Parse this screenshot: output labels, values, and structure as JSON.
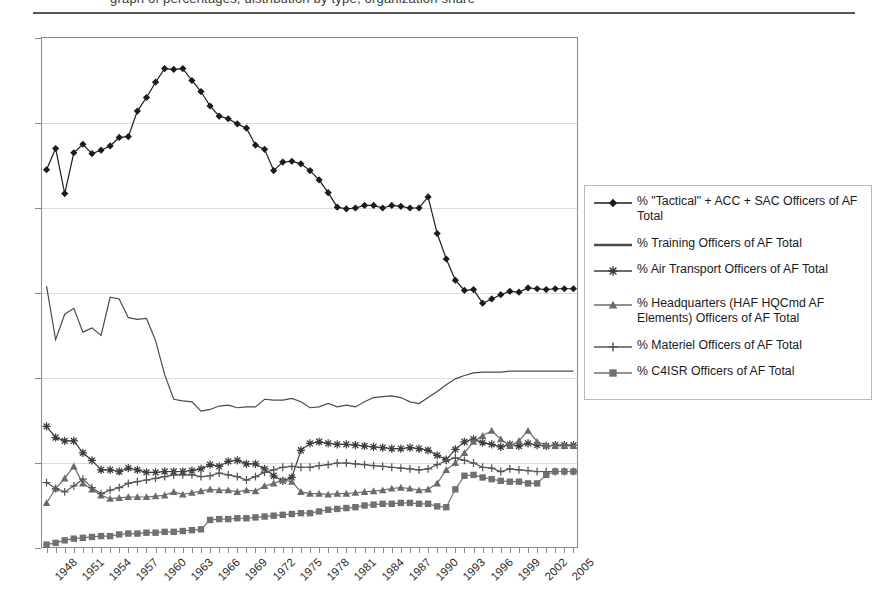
{
  "header": {
    "clipped_title_fragment": "graph of percentages, distribution by type, organization share",
    "rule": "horizontal-rule"
  },
  "legend": {
    "position": "right",
    "border_color": "#b9b9b9",
    "items": [
      {
        "label": "% \"Tactical\" + ACC + SAC Officers of AF Total",
        "marker": "diamond",
        "color": "#1b1b1b"
      },
      {
        "label": "% Training Officers of AF Total",
        "marker": "line",
        "color": "#4a4a4a"
      },
      {
        "label": "% Air Transport Officers of AF Total",
        "marker": "asterisk",
        "color": "#3d3d3d"
      },
      {
        "label": "% Headquarters (HAF HQCmd AF Elements) Officers of AF Total",
        "marker": "triangle",
        "color": "#6b6b6b"
      },
      {
        "label": "% Materiel Officers of AF Total",
        "marker": "plus",
        "color": "#555555"
      },
      {
        "label": "% C4ISR Officers of AF Total",
        "marker": "square",
        "color": "#707070"
      }
    ]
  },
  "chart_data": {
    "type": "line",
    "title": "",
    "xlabel": "",
    "ylabel": "",
    "ylim": [
      0,
      60
    ],
    "yticks": [
      "0%",
      "10%",
      "20%",
      "30%",
      "40%",
      "50%",
      "60%"
    ],
    "ytick_values": [
      0,
      10,
      20,
      30,
      40,
      50,
      60
    ],
    "grid": true,
    "legend_position": "right",
    "x": [
      1948,
      1949,
      1950,
      1951,
      1952,
      1953,
      1954,
      1955,
      1956,
      1957,
      1958,
      1959,
      1960,
      1961,
      1962,
      1963,
      1964,
      1965,
      1966,
      1967,
      1968,
      1969,
      1970,
      1971,
      1972,
      1973,
      1974,
      1975,
      1976,
      1977,
      1978,
      1979,
      1980,
      1981,
      1982,
      1983,
      1984,
      1985,
      1986,
      1987,
      1988,
      1989,
      1990,
      1991,
      1992,
      1993,
      1994,
      1995,
      1996,
      1997,
      1998,
      1999,
      2000,
      2001,
      2002,
      2003,
      2004,
      2005,
      2006
    ],
    "xtick_labels": [
      "1948",
      "1951",
      "1954",
      "1957",
      "1960",
      "1963",
      "1966",
      "1969",
      "1972",
      "1975",
      "1978",
      "1981",
      "1984",
      "1987",
      "1990",
      "1993",
      "1996",
      "1999",
      "2002"
    ],
    "xtick_label_step": 3,
    "series": [
      {
        "name": "% \"Tactical\" + ACC + SAC Officers of AF Total",
        "marker": "diamond",
        "color": "#1b1b1b",
        "values": [
          44.5,
          47.0,
          41.7,
          46.5,
          47.5,
          46.4,
          46.8,
          47.3,
          48.3,
          48.4,
          51.4,
          53.0,
          54.8,
          56.4,
          56.3,
          56.4,
          55.0,
          53.7,
          52.0,
          50.8,
          50.5,
          49.9,
          49.4,
          47.4,
          46.9,
          44.4,
          45.4,
          45.5,
          45.2,
          44.4,
          43.3,
          41.8,
          40.1,
          39.9,
          40.0,
          40.3,
          40.3,
          40.0,
          40.3,
          40.2,
          40.0,
          40.0,
          41.3,
          37.0,
          34.0,
          31.5,
          30.3,
          30.4,
          28.8,
          29.3,
          29.8,
          30.2,
          30.1,
          30.6,
          30.5,
          30.4,
          30.5,
          30.5,
          30.5
        ]
      },
      {
        "name": "% Training Officers of AF Total",
        "marker": "line",
        "color": "#4a4a4a",
        "values": [
          30.8,
          24.5,
          27.5,
          28.2,
          25.4,
          25.9,
          25.0,
          29.5,
          29.3,
          27.1,
          26.9,
          27.0,
          24.4,
          20.4,
          17.5,
          17.3,
          17.2,
          16.1,
          16.3,
          16.7,
          16.8,
          16.5,
          16.6,
          16.6,
          17.5,
          17.4,
          17.4,
          17.6,
          17.2,
          16.5,
          16.6,
          17.0,
          16.6,
          16.8,
          16.6,
          17.2,
          17.7,
          17.8,
          17.9,
          17.7,
          17.2,
          17.0,
          17.7,
          18.4,
          19.2,
          19.9,
          20.3,
          20.6,
          20.7,
          20.7,
          20.7,
          20.8,
          20.8,
          20.8,
          20.8,
          20.8,
          20.8,
          20.8,
          20.8
        ]
      },
      {
        "name": "% Air Transport Officers of AF Total",
        "marker": "asterisk",
        "color": "#3d3d3d",
        "values": [
          14.3,
          13.0,
          12.6,
          12.6,
          11.2,
          10.3,
          9.2,
          9.2,
          9.0,
          9.4,
          9.2,
          8.9,
          8.9,
          9.0,
          9.0,
          9.0,
          9.1,
          9.3,
          9.8,
          9.6,
          10.2,
          10.3,
          9.9,
          9.9,
          9.3,
          8.5,
          7.9,
          8.3,
          11.5,
          12.3,
          12.5,
          12.3,
          12.2,
          12.2,
          12.1,
          12.0,
          11.9,
          11.8,
          11.7,
          11.7,
          11.8,
          11.7,
          11.5,
          10.9,
          10.4,
          11.6,
          12.5,
          12.8,
          12.4,
          12.2,
          11.9,
          12.2,
          12.0,
          12.3,
          12.1,
          12.0,
          12.1,
          12.1,
          12.1
        ]
      },
      {
        "name": "% Headquarters (HAF HQCmd AF Elements) Officers of AF Total",
        "marker": "triangle",
        "color": "#6b6b6b",
        "values": [
          5.3,
          7.0,
          8.2,
          9.6,
          7.6,
          6.9,
          6.2,
          5.8,
          5.9,
          6.0,
          6.0,
          6.0,
          6.1,
          6.2,
          6.6,
          6.3,
          6.5,
          6.7,
          6.9,
          6.8,
          6.8,
          6.6,
          6.8,
          6.7,
          7.3,
          7.6,
          8.0,
          7.8,
          6.6,
          6.4,
          6.4,
          6.3,
          6.4,
          6.4,
          6.5,
          6.6,
          6.7,
          6.8,
          7.0,
          7.1,
          7.0,
          6.8,
          6.9,
          7.6,
          9.2,
          10.0,
          11.2,
          12.5,
          13.2,
          13.8,
          12.8,
          12.0,
          12.6,
          13.8,
          12.5,
          12.1,
          12.0,
          12.0,
          12.0
        ]
      },
      {
        "name": "% Materiel Officers of AF Total",
        "marker": "plus",
        "color": "#555555",
        "values": [
          7.7,
          7.0,
          6.6,
          7.3,
          8.1,
          7.1,
          6.4,
          6.8,
          7.1,
          7.6,
          7.8,
          8.0,
          8.2,
          8.4,
          8.6,
          8.6,
          8.6,
          8.4,
          8.5,
          8.8,
          8.6,
          8.4,
          8.0,
          8.4,
          8.9,
          9.2,
          9.5,
          9.6,
          9.5,
          9.5,
          9.7,
          9.8,
          10.0,
          10.0,
          9.9,
          9.8,
          9.7,
          9.6,
          9.5,
          9.4,
          9.3,
          9.2,
          9.3,
          9.8,
          10.3,
          10.6,
          10.3,
          10.0,
          9.5,
          9.4,
          9.0,
          9.3,
          9.2,
          9.1,
          9.0,
          9.0,
          9.0,
          9.0,
          9.0
        ]
      },
      {
        "name": "% C4ISR Officers of AF Total",
        "marker": "square",
        "color": "#707070",
        "values": [
          0.4,
          0.6,
          0.9,
          1.1,
          1.2,
          1.3,
          1.4,
          1.4,
          1.6,
          1.7,
          1.7,
          1.8,
          1.8,
          1.9,
          1.9,
          2.0,
          2.1,
          2.2,
          3.3,
          3.4,
          3.4,
          3.5,
          3.5,
          3.6,
          3.7,
          3.8,
          3.9,
          4.0,
          4.1,
          4.1,
          4.3,
          4.5,
          4.6,
          4.7,
          4.8,
          5.0,
          5.1,
          5.2,
          5.2,
          5.3,
          5.3,
          5.2,
          5.2,
          4.9,
          4.8,
          6.9,
          8.5,
          8.6,
          8.3,
          8.1,
          7.9,
          7.8,
          7.8,
          7.6,
          7.6,
          8.6,
          9.0,
          9.0,
          9.0
        ]
      }
    ]
  }
}
